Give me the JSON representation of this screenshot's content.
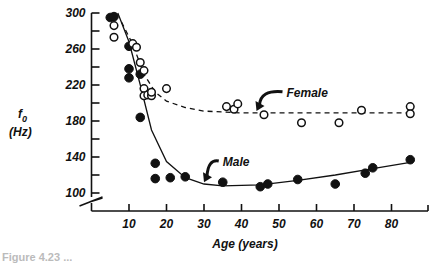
{
  "chart_data": {
    "type": "scatter",
    "title": "",
    "xlabel": "Age (years)",
    "ylabel": "f0 (Hz)",
    "ylabel_symbol": "f",
    "ylabel_subscript": "0",
    "ylabel_unit": "(Hz)",
    "xlim": [
      0,
      90
    ],
    "ylim": [
      100,
      300
    ],
    "y_axis_break": true,
    "grid": false,
    "x_ticks": [
      10,
      20,
      30,
      40,
      50,
      60,
      70,
      80
    ],
    "y_ticks_labeled": [
      100,
      140,
      180,
      220,
      260,
      300
    ],
    "y_ticks_minor": [
      120,
      160,
      200,
      240,
      280
    ],
    "series": [
      {
        "name": "Male",
        "marker": "filled-circle",
        "fit_line": "solid",
        "points": [
          [
            5,
            295
          ],
          [
            6,
            296
          ],
          [
            10,
            263
          ],
          [
            10,
            238
          ],
          [
            10,
            228
          ],
          [
            13,
            232
          ],
          [
            13,
            184
          ],
          [
            17,
            133
          ],
          [
            17,
            116
          ],
          [
            21,
            117
          ],
          [
            25,
            118
          ],
          [
            35,
            112
          ],
          [
            45,
            107
          ],
          [
            47,
            110
          ],
          [
            55,
            115
          ],
          [
            65,
            110
          ],
          [
            73,
            122
          ],
          [
            75,
            128
          ],
          [
            85,
            137
          ]
        ],
        "fit": [
          [
            7,
            300
          ],
          [
            10,
            268
          ],
          [
            13,
            220
          ],
          [
            16,
            170
          ],
          [
            20,
            135
          ],
          [
            25,
            117
          ],
          [
            30,
            110
          ],
          [
            35,
            108
          ],
          [
            45,
            109
          ],
          [
            55,
            114
          ],
          [
            65,
            120
          ],
          [
            75,
            127
          ],
          [
            85,
            134
          ]
        ]
      },
      {
        "name": "Female",
        "marker": "open-circle",
        "fit_line": "dashed",
        "points": [
          [
            6,
            286
          ],
          [
            6,
            273
          ],
          [
            11,
            266
          ],
          [
            12,
            262
          ],
          [
            13,
            245
          ],
          [
            14,
            236
          ],
          [
            14,
            216
          ],
          [
            14,
            208
          ],
          [
            15,
            209
          ],
          [
            16,
            208
          ],
          [
            16,
            212
          ],
          [
            20,
            216
          ],
          [
            36,
            196
          ],
          [
            38,
            193
          ],
          [
            39,
            199
          ],
          [
            46,
            187
          ],
          [
            56,
            178
          ],
          [
            66,
            178
          ],
          [
            72,
            192
          ],
          [
            85,
            196
          ],
          [
            85,
            188
          ]
        ],
        "fit": [
          [
            8,
            290
          ],
          [
            11,
            265
          ],
          [
            14,
            232
          ],
          [
            17,
            212
          ],
          [
            20,
            202
          ],
          [
            25,
            195
          ],
          [
            30,
            191
          ],
          [
            40,
            189
          ],
          [
            50,
            189
          ],
          [
            60,
            189
          ],
          [
            72,
            189
          ],
          [
            85,
            189
          ]
        ]
      }
    ],
    "annotations": [
      {
        "text": "Female",
        "x": 52,
        "y": 207,
        "arrow_to": [
          44,
          191
        ]
      },
      {
        "text": "Male",
        "x": 35,
        "y": 130,
        "arrow_to": [
          30,
          112
        ]
      }
    ]
  },
  "caption": "Figure 4.23  ..."
}
